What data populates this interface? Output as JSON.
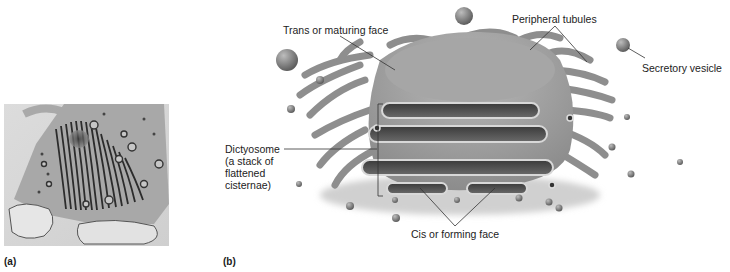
{
  "figure": {
    "panels": [
      {
        "id": "a",
        "label": "(a)",
        "content": "electron micrograph of Golgi apparatus (dictyosome)"
      },
      {
        "id": "b",
        "label": "(b)",
        "content": "3D illustration of Golgi apparatus"
      }
    ],
    "annotations": {
      "trans_face": "Trans or maturing face",
      "peripheral_tubules": "Peripheral tubules",
      "secretory_vesicle": "Secretory vesicle",
      "dictyosome_line1": "Dictyosome",
      "dictyosome_line2": "(a stack of",
      "dictyosome_line3": "flattened",
      "dictyosome_line4": "cisternae)",
      "cis_face": "Cis or forming face"
    },
    "colors": {
      "background": "#ffffff",
      "organelle_body": "#9a9a9a",
      "organelle_light": "#c4c4c4",
      "cisterna_lumen": "#4a4a4a",
      "vesicle": "#7a7a7a",
      "leader_line": "#333333"
    }
  }
}
